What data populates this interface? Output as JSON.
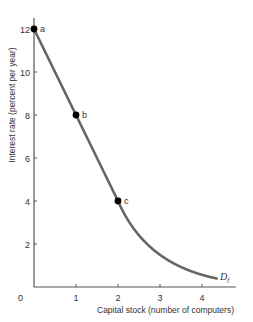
{
  "chart_data": {
    "type": "line",
    "title": "",
    "xlabel": "Capital stock (number of computers)",
    "ylabel": "Interest rate (percent per year)",
    "xlim": [
      0,
      4.6
    ],
    "ylim": [
      0,
      13
    ],
    "x_ticks": [
      0,
      1,
      2,
      3,
      4
    ],
    "y_ticks": [
      2,
      4,
      6,
      8,
      10,
      12
    ],
    "grid": false,
    "legend": "none",
    "series": [
      {
        "name": "Df",
        "x": [
          0,
          0.5,
          1,
          1.5,
          2,
          2.5,
          3,
          3.5,
          4,
          4.35
        ],
        "values": [
          12,
          10,
          8,
          6,
          4,
          2.3,
          1.2,
          0.7,
          0.45,
          0.4
        ],
        "color": "#666666"
      }
    ],
    "points": [
      {
        "label": "a",
        "x": 0,
        "y": 12
      },
      {
        "label": "b",
        "x": 1,
        "y": 8
      },
      {
        "label": "c",
        "x": 2,
        "y": 4
      }
    ],
    "annotations": [
      {
        "text": "D",
        "subscript": "f",
        "x": 4.35,
        "y": 0.4
      }
    ]
  },
  "labels": {
    "origin": "0",
    "curve_name": "D",
    "curve_sub": "f"
  },
  "colors": {
    "axis": "#555555",
    "curve": "#666666",
    "point": "#000000",
    "text": "#333333"
  }
}
